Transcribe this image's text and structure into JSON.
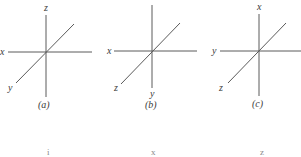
{
  "figure": {
    "panels": [
      {
        "id": "a",
        "caption": "(a)",
        "labels": {
          "vertical_top": "z",
          "horizontal_left": "x",
          "diagonal_bottom_left": "y"
        }
      },
      {
        "id": "b",
        "caption": "(b)",
        "labels": {
          "horizontal_left": "x",
          "diagonal_bottom_left": "z",
          "vertical_bottom": "y"
        }
      },
      {
        "id": "c",
        "caption": "(c)",
        "labels": {
          "vertical_top": "x",
          "horizontal_left": "y",
          "diagonal_bottom_left": "z"
        }
      }
    ],
    "bottom_row": [
      "i",
      "x",
      "z"
    ],
    "colors": {
      "line": "#5a5a5a",
      "text": "#3a3a3a",
      "background": "#ffffff"
    }
  }
}
